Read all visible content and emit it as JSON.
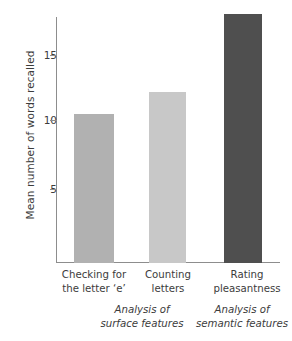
{
  "chart_data": {
    "type": "bar",
    "title": "",
    "xlabel": "",
    "ylabel": "Mean number of words recalled",
    "categories": [
      "Checking for the letter 'e'",
      "Counting letters",
      "Rating pleasantness"
    ],
    "category_lines": [
      [
        "Checking for",
        "the letter ‘e’"
      ],
      [
        "Counting",
        "letters"
      ],
      [
        "Rating",
        "pleasantness"
      ]
    ],
    "values": [
      10.5,
      12.0,
      17.5
    ],
    "bar_colors": [
      "#b1b1b1",
      "#c8c8c8",
      "#4f4f4f"
    ],
    "ylim": [
      0,
      18
    ],
    "yticks": [
      5,
      10,
      15
    ],
    "ytick_labels": [
      "5",
      "10",
      "15"
    ],
    "grid": false,
    "legend": null,
    "annotations": [
      {
        "text": "Analysis of surface features",
        "lines": [
          "Analysis of",
          "surface features"
        ],
        "spans_categories": [
          0,
          1
        ],
        "style": "italic"
      },
      {
        "text": "Analysis of semantic features",
        "lines": [
          "Analysis of",
          "semantic features"
        ],
        "spans_categories": [
          2
        ],
        "style": "italic"
      }
    ],
    "axis_color": "#8d8d8d",
    "text_color": "#3c3c3c",
    "background": "#ffffff"
  }
}
